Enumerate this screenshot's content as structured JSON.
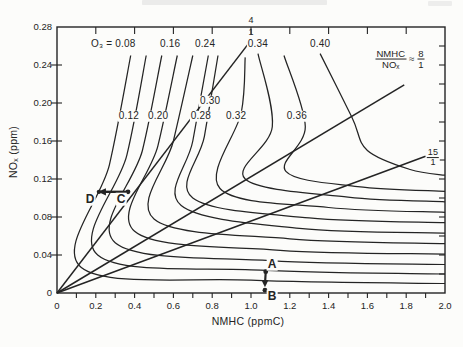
{
  "page": {
    "background": "#fcfcfa",
    "ink": "#242424"
  },
  "chart_data": {
    "type": "line",
    "subtype": "ozone-isopleth-diagram",
    "title": "",
    "xlabel": "NMHC (ppmC)",
    "ylabel": "NOₓ (ppm)",
    "xlim": [
      0,
      2.0
    ],
    "ylim": [
      0,
      0.28
    ],
    "grid": false,
    "x_tick_labels": [
      "0",
      "0.2",
      "0.4",
      "0.6",
      "0.8",
      "1.0",
      "1.2",
      "1.4",
      "1.6",
      "1.8",
      "2.0"
    ],
    "y_tick_labels": [
      "0",
      "0.04",
      "0.08",
      "0.12",
      "0.16",
      "0.20",
      "0.24",
      "0.28"
    ],
    "isopleths": [
      {
        "value": 0.08,
        "label": "O₃ = 0.08",
        "label_at": [
          0.29,
          0.262
        ],
        "points": [
          [
            0.38,
            0.25
          ],
          [
            0.27,
            0.135
          ],
          [
            0.125,
            0.027
          ],
          [
            1.0,
            0.0135
          ],
          [
            2.0,
            0.01
          ]
        ]
      },
      {
        "value": 0.12,
        "label": "0.12",
        "label_at": [
          0.371,
          0.186
        ],
        "points": [
          [
            0.46,
            0.25
          ],
          [
            0.36,
            0.145
          ],
          [
            0.21,
            0.04
          ],
          [
            1.05,
            0.024
          ],
          [
            2.0,
            0.02
          ]
        ]
      },
      {
        "value": 0.16,
        "label": "0.16",
        "label_at": [
          0.583,
          0.262
        ],
        "points": [
          [
            0.54,
            0.25
          ],
          [
            0.44,
            0.15
          ],
          [
            0.3,
            0.053
          ],
          [
            1.1,
            0.034
          ],
          [
            2.0,
            0.03
          ]
        ]
      },
      {
        "value": 0.2,
        "label": "0.20",
        "label_at": [
          0.521,
          0.186
        ],
        "points": [
          [
            0.62,
            0.25
          ],
          [
            0.52,
            0.155
          ],
          [
            0.4,
            0.065
          ],
          [
            1.15,
            0.045
          ],
          [
            2.0,
            0.041
          ]
        ]
      },
      {
        "value": 0.24,
        "label": "0.24",
        "label_at": [
          0.763,
          0.262
        ],
        "points": [
          [
            0.7,
            0.25
          ],
          [
            0.6,
            0.16
          ],
          [
            0.5,
            0.078
          ],
          [
            1.2,
            0.057
          ],
          [
            2.0,
            0.052
          ]
        ]
      },
      {
        "value": 0.28,
        "label": "0.28",
        "label_at": [
          0.742,
          0.186
        ],
        "points": [
          [
            0.78,
            0.25
          ],
          [
            0.7,
            0.16
          ],
          [
            0.64,
            0.092
          ],
          [
            1.25,
            0.068
          ],
          [
            2.0,
            0.063
          ]
        ]
      },
      {
        "value": 0.3,
        "label": "0.30",
        "label_at": [
          0.789,
          0.202
        ],
        "points": [
          [
            0.83,
            0.25
          ],
          [
            0.76,
            0.165
          ],
          [
            0.7,
            0.1
          ],
          [
            1.3,
            0.079
          ],
          [
            2.0,
            0.074
          ]
        ]
      },
      {
        "value": 0.32,
        "label": "0.32",
        "label_at": [
          0.923,
          0.186
        ],
        "points": [
          [
            0.97,
            0.248
          ],
          [
            0.95,
            0.19
          ],
          [
            0.84,
            0.11
          ],
          [
            1.4,
            0.09
          ],
          [
            2.0,
            0.085
          ]
        ]
      },
      {
        "value": 0.34,
        "label": "0.34",
        "label_at": [
          1.036,
          0.262
        ],
        "points": [
          [
            1.036,
            0.252
          ],
          [
            1.11,
            0.175
          ],
          [
            0.97,
            0.12
          ],
          [
            1.5,
            0.101
          ],
          [
            2.0,
            0.096
          ]
        ]
      },
      {
        "value": 0.36,
        "label": "0.36",
        "label_at": [
          1.237,
          0.186
        ],
        "points": [
          [
            1.17,
            0.25
          ],
          [
            1.28,
            0.175
          ],
          [
            1.18,
            0.128
          ],
          [
            1.55,
            0.112
          ],
          [
            2.0,
            0.107
          ]
        ]
      },
      {
        "value": 0.4,
        "label": "0.40",
        "label_at": [
          1.356,
          0.262
        ],
        "points": [
          [
            1.356,
            0.252
          ],
          [
            1.52,
            0.185
          ],
          [
            1.6,
            0.15
          ],
          [
            1.82,
            0.13
          ],
          [
            2.0,
            0.124
          ]
        ]
      }
    ],
    "ratio_lines": [
      {
        "name": "4/1",
        "num": "4",
        "den": "1",
        "from": [
          0,
          0
        ],
        "to": [
          0.985,
          0.262
        ],
        "label_at_px": [
          251,
          27
        ]
      },
      {
        "name": "8/1",
        "num_prefix": "NMHC",
        "den_prefix": "NOₓ",
        "approx": "≈",
        "num": "8",
        "den": "1",
        "from": [
          0,
          0
        ],
        "to": [
          1.79,
          0.219
        ],
        "label_at_px": [
          400,
          59
        ]
      },
      {
        "name": "15/1",
        "num": "15",
        "den": "1",
        "from": [
          0,
          0
        ],
        "to": [
          1.9,
          0.144
        ],
        "label_at_px": [
          433,
          158
        ]
      }
    ],
    "annotations": {
      "points": [
        {
          "name": "A",
          "at": [
            1.076,
            0.0225
          ],
          "label_at_px": [
            272,
            264
          ]
        },
        {
          "name": "B",
          "at": [
            1.072,
            0.003
          ],
          "label_at_px": [
            272,
            296
          ]
        },
        {
          "name": "C",
          "at": [
            0.366,
            0.1065
          ],
          "label_at_px": [
            121,
            199
          ]
        },
        {
          "name": "D",
          "at": [
            0.211,
            0.1065
          ],
          "label_at_px": [
            90,
            199
          ]
        }
      ],
      "arrows": [
        {
          "from": "A",
          "to": "B",
          "head": "down"
        },
        {
          "from": "C",
          "to": "D",
          "head": "left"
        }
      ]
    }
  }
}
